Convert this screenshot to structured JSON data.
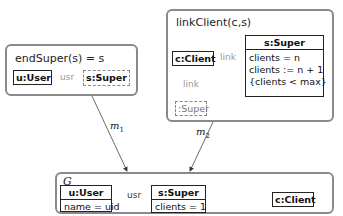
{
  "rules": {
    "end_super": {
      "title": "endSuper(s) = s",
      "nodes": {
        "user": "u:User",
        "super": "s:Super"
      },
      "edge_label": "usr"
    },
    "link_client": {
      "title": "linkClient(c,s)",
      "nodes": {
        "client": "c:Client",
        "super": {
          "header": "s:Super",
          "attrs": [
            "clients = n",
            "clients := n + 1",
            "{clients < max}"
          ]
        },
        "nac_super": ":Super"
      },
      "edge_label_right": "link",
      "edge_label_down": "link"
    }
  },
  "morphisms": {
    "m1": "m",
    "m1_sub": "1",
    "m2": "m",
    "m2_sub": "2"
  },
  "graph": {
    "title": "G",
    "user": {
      "header": "u:User",
      "attrs": [
        "name = uid"
      ]
    },
    "super": {
      "header": "s:Super",
      "attrs": [
        "clients = 1"
      ]
    },
    "client": "c:Client",
    "edge_label": "usr"
  }
}
